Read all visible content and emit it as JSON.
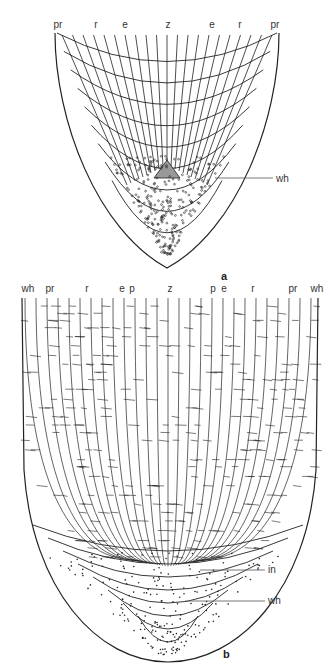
{
  "panel_a": {
    "panel_label": "a",
    "top_labels": [
      "pr",
      "r",
      "e",
      "z",
      "e",
      "r",
      "pr"
    ],
    "side_labels": [
      {
        "text": "wh"
      }
    ]
  },
  "panel_b": {
    "panel_label": "b",
    "top_labels": [
      "wh",
      "pr",
      "r",
      "e",
      "p",
      "z",
      "p",
      "e",
      "r",
      "pr",
      "wh"
    ],
    "side_labels": [
      {
        "text": "in"
      },
      {
        "text": "wh"
      }
    ]
  },
  "colors": {
    "ink": "#222222",
    "label": "#333333",
    "background": "#ffffff"
  }
}
